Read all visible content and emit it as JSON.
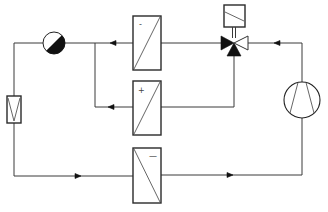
{
  "diagram": {
    "type": "refrigeration-circuit schematic",
    "line_color": "#3a3a3a",
    "fill_color": "#111111",
    "components": [
      {
        "id": "sight-glass",
        "symbol": "half-filled circle",
        "label": ""
      },
      {
        "id": "filter-drier",
        "symbol": "rectangle with V",
        "label": ""
      },
      {
        "id": "heat-exchanger-top",
        "symbol": "rectangle with diagonal",
        "sign": "-"
      },
      {
        "id": "heat-exchanger-middle",
        "symbol": "rectangle with diagonal",
        "sign": "+"
      },
      {
        "id": "heat-exchanger-bottom",
        "symbol": "rectangle with diagonal",
        "sign": "—"
      },
      {
        "id": "three-way-valve",
        "symbol": "three triangles with actuator box",
        "label": ""
      },
      {
        "id": "compressor",
        "symbol": "circle with two converging lines",
        "label": ""
      }
    ],
    "flow_arrows": [
      {
        "location": "top line, right of valve",
        "direction": "left"
      },
      {
        "location": "top line, left of top heat exchanger",
        "direction": "left"
      },
      {
        "location": "branch line into middle heat exchanger",
        "direction": "left"
      },
      {
        "location": "bottom line, left segment",
        "direction": "right"
      },
      {
        "location": "bottom line, right segment",
        "direction": "right"
      }
    ],
    "signs": {
      "top": "-",
      "middle": "+",
      "bottom": "—"
    }
  }
}
